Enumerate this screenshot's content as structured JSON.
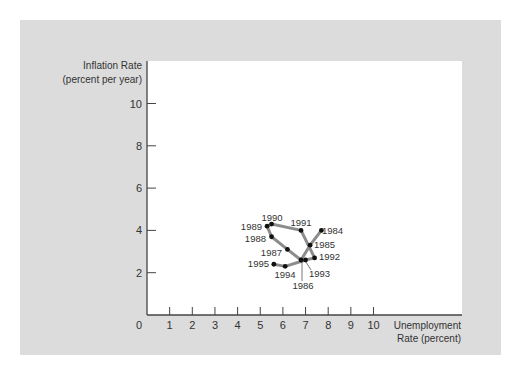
{
  "chart_data": {
    "type": "line",
    "title": "",
    "ylabel": [
      "Inflation Rate",
      "(percent per year)"
    ],
    "xlabel": [
      "Unemployment",
      "Rate (percent)"
    ],
    "xlim": [
      0,
      10
    ],
    "ylim": [
      0,
      10
    ],
    "x_ticks": [
      1,
      2,
      3,
      4,
      5,
      6,
      7,
      8,
      9,
      10
    ],
    "y_ticks": [
      2,
      4,
      6,
      8,
      10
    ],
    "origin_label": "0",
    "grid": false,
    "legend": null,
    "series": [
      {
        "name": "Inflation vs Unemployment, 1984-1995",
        "points": [
          {
            "year": "1984",
            "x": 7.7,
            "y": 4.0
          },
          {
            "year": "1985",
            "x": 7.2,
            "y": 3.3
          },
          {
            "year": "1986",
            "x": 6.8,
            "y": 2.6
          },
          {
            "year": "1987",
            "x": 6.2,
            "y": 3.1
          },
          {
            "year": "1988",
            "x": 5.5,
            "y": 3.7
          },
          {
            "year": "1989",
            "x": 5.3,
            "y": 4.2
          },
          {
            "year": "1990",
            "x": 5.5,
            "y": 4.3
          },
          {
            "year": "1991",
            "x": 6.8,
            "y": 4.0
          },
          {
            "year": "1992",
            "x": 7.4,
            "y": 2.7
          },
          {
            "year": "1993",
            "x": 7.0,
            "y": 2.6
          },
          {
            "year": "1994",
            "x": 6.1,
            "y": 2.3
          },
          {
            "year": "1995",
            "x": 5.6,
            "y": 2.4
          }
        ]
      }
    ],
    "point_labels": [
      {
        "year": "1984",
        "lx": 322,
        "ly": 234,
        "anchor": "start"
      },
      {
        "year": "1985",
        "lx": 314,
        "ly": 248,
        "anchor": "start"
      },
      {
        "year": "1986",
        "lx": 303,
        "ly": 289,
        "anchor": "middle",
        "leader": [
          302,
          262,
          302,
          281
        ]
      },
      {
        "year": "1987",
        "lx": 282,
        "ly": 256,
        "anchor": "end"
      },
      {
        "year": "1988",
        "lx": 266,
        "ly": 242,
        "anchor": "end"
      },
      {
        "year": "1989",
        "lx": 262,
        "ly": 230,
        "anchor": "end"
      },
      {
        "year": "1990",
        "lx": 272,
        "ly": 221,
        "anchor": "middle"
      },
      {
        "year": "1991",
        "lx": 301,
        "ly": 226,
        "anchor": "middle"
      },
      {
        "year": "1992",
        "lx": 319,
        "ly": 260,
        "anchor": "start"
      },
      {
        "year": "1993",
        "lx": 309,
        "ly": 277,
        "anchor": "start",
        "leader": [
          306,
          262,
          311,
          270
        ]
      },
      {
        "year": "1994",
        "lx": 285,
        "ly": 278,
        "anchor": "middle"
      },
      {
        "year": "1995",
        "lx": 269,
        "ly": 267,
        "anchor": "end"
      }
    ]
  },
  "style": {
    "panel_color": "#dcdcdc",
    "plot_color": "#ffffff",
    "axis_color": "#444444",
    "line_color": "#8c8c8c",
    "dot_color": "#111111",
    "text_color": "#333333"
  }
}
